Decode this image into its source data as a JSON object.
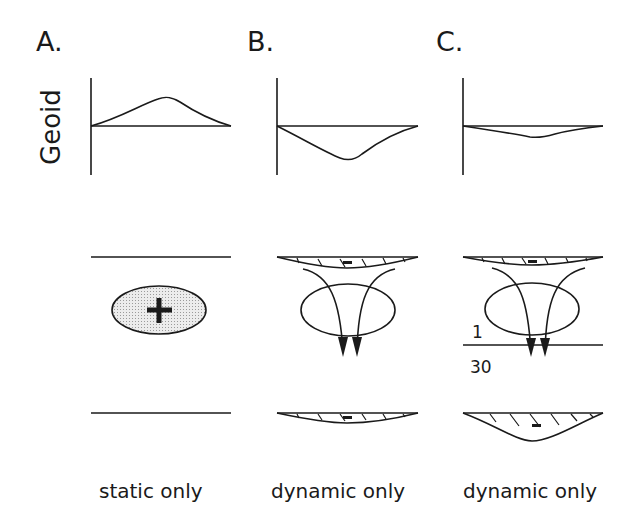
{
  "figure": {
    "y_axis_label": "Geoid",
    "panels": [
      {
        "id": "A",
        "label": "A.",
        "caption": "static only",
        "geoid_shape": "positive-bump",
        "anomaly_sign": "+",
        "boundaries": [
          "top-flat",
          "bottom-flat"
        ]
      },
      {
        "id": "B",
        "label": "B.",
        "caption": "dynamic only",
        "geoid_shape": "large-negative-dip",
        "anomaly_sign": "-",
        "boundaries": [
          "top-deflected",
          "bottom-deflected"
        ],
        "flow_arrows": 2
      },
      {
        "id": "C",
        "label": "C.",
        "caption": "dynamic only",
        "geoid_shape": "small-negative-dip",
        "anomaly_sign": "-",
        "boundaries": [
          "top-deflected",
          "bottom-deflected-deep"
        ],
        "flow_arrows": 2,
        "viscosity_layer": {
          "upper": "1",
          "lower": "30"
        }
      }
    ],
    "colors": {
      "ink": "#1a1a1a",
      "stipple_fill": "#e4e4e4",
      "background": "#ffffff"
    }
  }
}
